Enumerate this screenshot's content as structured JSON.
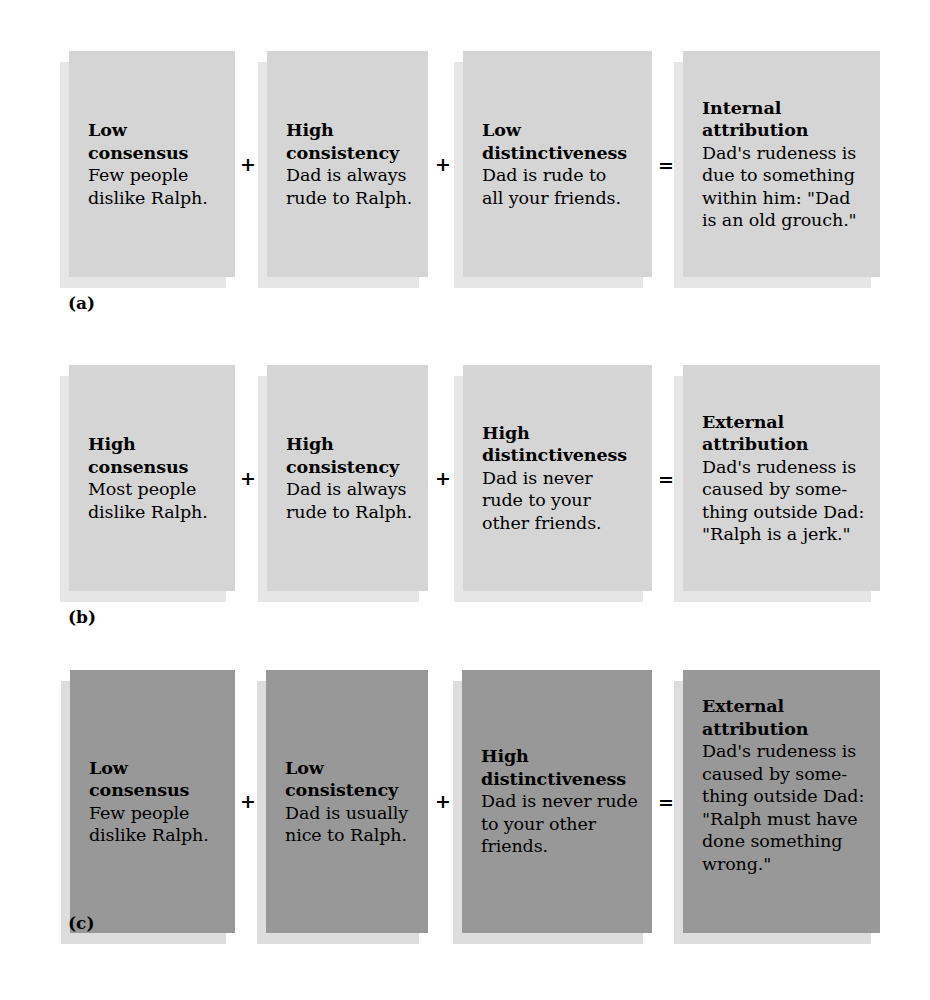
{
  "figure": {
    "type": "attribution-theory-diagram",
    "background_color": "#ffffff",
    "box_fill_light": "#d5d5d5",
    "box_fill_dark": "#989898",
    "shadow_color": "#e6e6e6",
    "text_color": "#000000"
  },
  "operators": {
    "plus": "+",
    "equals": "="
  },
  "panels": [
    {
      "label": "(a)",
      "tone": "light",
      "cells": [
        {
          "heading": "Low\nconsensus",
          "heading_line1": "Low",
          "heading_line2": "consensus",
          "body": "Few people dislike Ralph.",
          "body_line1": "Few people",
          "body_line2": "dislike Ralph.",
          "operator_after": "+"
        },
        {
          "heading_line1": "High",
          "heading_line2": "consistency",
          "body_line1": "Dad is always",
          "body_line2": "rude to Ralph.",
          "operator_after": "+"
        },
        {
          "heading_line1": "Low",
          "heading_line2": "distinctiveness",
          "body_line1": "Dad is rude to",
          "body_line2": "all your friends.",
          "operator_after": "="
        },
        {
          "heading_line1": "Internal",
          "heading_line2": "attribution",
          "body_line1": "Dad's rudeness is",
          "body_line2": "due to something",
          "body_line3": "within him: \"Dad",
          "body_line4": "is an old grouch.\"",
          "operator_after": ""
        }
      ]
    },
    {
      "label": "(b)",
      "tone": "light",
      "cells": [
        {
          "heading_line1": "High",
          "heading_line2": "consensus",
          "body_line1": "Most people",
          "body_line2": "dislike Ralph.",
          "operator_after": "+"
        },
        {
          "heading_line1": "High",
          "heading_line2": "consistency",
          "body_line1": "Dad is always",
          "body_line2": "rude to Ralph.",
          "operator_after": "+"
        },
        {
          "heading_line1": "High",
          "heading_line2": "distinctiveness",
          "body_line1": "Dad is never",
          "body_line2": "rude to your",
          "body_line3": "other friends.",
          "operator_after": "="
        },
        {
          "heading_line1": "External",
          "heading_line2": "attribution",
          "body_line1": "Dad's rudeness is",
          "body_line2": "caused by some-",
          "body_line3": "thing outside Dad:",
          "body_line4": "\"Ralph is a jerk.\"",
          "operator_after": ""
        }
      ]
    },
    {
      "label": "(c)",
      "tone": "dark",
      "cells": [
        {
          "heading_line1": "Low",
          "heading_line2": "consensus",
          "body_line1": "Few people",
          "body_line2": "dislike Ralph.",
          "operator_after": "+"
        },
        {
          "heading_line1": "Low",
          "heading_line2": "consistency",
          "body_line1": "Dad is usually",
          "body_line2": "nice to Ralph.",
          "operator_after": "+"
        },
        {
          "heading_line1": "High",
          "heading_line2": "distinctiveness",
          "body_line1": "Dad is never rude",
          "body_line2": "to your other",
          "body_line3": "friends.",
          "operator_after": "="
        },
        {
          "heading_line1": "External",
          "heading_line2": "attribution",
          "body_line1": "Dad's rudeness is",
          "body_line2": "caused by some-",
          "body_line3": "thing outside Dad:",
          "body_line4": "\"Ralph must have",
          "body_line5": "done something",
          "body_line6": "wrong.\"",
          "operator_after": ""
        }
      ]
    }
  ]
}
